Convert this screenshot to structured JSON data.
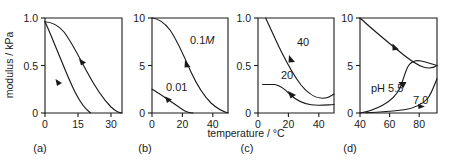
{
  "figure": {
    "shared_xlabel": "temperature / °C",
    "shared_ylabel": "modulus / kPa"
  },
  "chart_data": [
    {
      "type": "line",
      "panel": "(a)",
      "title": "",
      "xlabel": "temperature / °C",
      "ylabel": "modulus / kPa",
      "xlim": [
        0,
        35
      ],
      "ylim": [
        0,
        1.0
      ],
      "xticks": [
        0,
        15,
        30
      ],
      "xticklabels": [
        "0",
        "15",
        "30"
      ],
      "yticks": [
        0,
        0.5,
        1.0
      ],
      "yticklabels": [
        "0",
        "0.5",
        "1.0"
      ],
      "grid": false,
      "legend": "none",
      "series": [
        {
          "name": "upper-curve",
          "label": "",
          "x": [
            0,
            3,
            6,
            9,
            12,
            15,
            18,
            21,
            24,
            27,
            30,
            33,
            35
          ],
          "y": [
            0.96,
            0.955,
            0.94,
            0.9,
            0.84,
            0.75,
            0.64,
            0.52,
            0.39,
            0.26,
            0.13,
            0.04,
            0.0
          ]
        },
        {
          "name": "lower-curve",
          "label": "",
          "x": [
            0,
            2,
            4,
            6,
            8,
            10,
            12,
            14,
            16,
            18,
            20,
            22,
            23
          ],
          "y": [
            0.96,
            0.9,
            0.82,
            0.72,
            0.62,
            0.5,
            0.39,
            0.28,
            0.18,
            0.1,
            0.04,
            0.01,
            0.0
          ]
        }
      ]
    },
    {
      "type": "line",
      "panel": "(b)",
      "title": "",
      "xlabel": "temperature / °C",
      "ylabel": "modulus / kPa",
      "xlim": [
        0,
        50
      ],
      "ylim": [
        0,
        10
      ],
      "xticks": [
        0,
        20,
        40
      ],
      "xticklabels": [
        "0",
        "20",
        "40"
      ],
      "yticks": [
        0,
        5,
        10
      ],
      "yticklabels": [
        "0",
        "5",
        "10"
      ],
      "grid": false,
      "legend": "inline-annotations",
      "series": [
        {
          "name": "conc-0p1M",
          "label": "0.1M",
          "label_italic_tail": "M",
          "x": [
            0,
            5,
            10,
            15,
            20,
            25,
            30,
            35,
            40,
            45,
            50
          ],
          "y": [
            10.0,
            9.85,
            9.5,
            9.0,
            8.2,
            7.1,
            5.7,
            4.1,
            2.6,
            1.5,
            0.8
          ]
        },
        {
          "name": "conc-0p01",
          "label": "0.01",
          "x": [
            0,
            4,
            8,
            12,
            16,
            20,
            24,
            27
          ],
          "y": [
            2.5,
            2.2,
            1.85,
            1.45,
            1.0,
            0.55,
            0.15,
            0.0
          ]
        }
      ]
    },
    {
      "type": "line",
      "panel": "(c)",
      "title": "",
      "xlabel": "temperature / °C",
      "ylabel": "modulus / kPa",
      "xlim": [
        0,
        50
      ],
      "ylim": [
        0,
        1.0
      ],
      "xticks": [
        0,
        20,
        40
      ],
      "xticklabels": [
        "0",
        "20",
        "40"
      ],
      "yticks": [
        0,
        0.5,
        1.0
      ],
      "yticklabels": [
        "0",
        "0.5",
        "1.0"
      ],
      "grid": false,
      "legend": "inline-annotations",
      "series": [
        {
          "name": "curve-40",
          "label": "40",
          "x": [
            5,
            10,
            15,
            20,
            25,
            30,
            35,
            40,
            45,
            50
          ],
          "y": [
            1.0,
            0.84,
            0.7,
            0.58,
            0.48,
            0.39,
            0.32,
            0.27,
            0.23,
            0.2
          ]
        },
        {
          "name": "curve-20",
          "label": "20",
          "x": [
            3,
            8,
            12,
            16,
            20,
            24,
            28,
            32,
            36,
            40,
            45,
            50
          ],
          "y": [
            0.3,
            0.3,
            0.29,
            0.26,
            0.22,
            0.18,
            0.15,
            0.13,
            0.11,
            0.1,
            0.09,
            0.09
          ]
        }
      ]
    },
    {
      "type": "line",
      "panel": "(d)",
      "title": "",
      "xlabel": "temperature / °C",
      "ylabel": "modulus / kPa",
      "xlim": [
        40,
        92
      ],
      "ylim": [
        0,
        10
      ],
      "xticks": [
        40,
        60,
        80
      ],
      "xticklabels": [
        "40",
        "60",
        "80"
      ],
      "yticks": [
        0,
        5,
        10
      ],
      "yticklabels": [
        "0",
        "5",
        "10"
      ],
      "grid": false,
      "legend": "inline-annotations",
      "series": [
        {
          "name": "descending-curve",
          "label": "",
          "x": [
            40,
            50,
            60,
            70,
            78,
            84,
            88,
            92
          ],
          "y": [
            10.0,
            8.85,
            7.65,
            6.45,
            5.75,
            5.35,
            5.12,
            4.95
          ]
        },
        {
          "name": "pH-5p5-curve",
          "label": "pH 5.5",
          "x": [
            40,
            48,
            56,
            63,
            68,
            71,
            73,
            74.5,
            76,
            78,
            81,
            85,
            89,
            92
          ],
          "y": [
            0.0,
            0.12,
            0.28,
            0.48,
            0.75,
            1.25,
            2.3,
            3.6,
            4.5,
            4.95,
            5.15,
            5.12,
            5.05,
            4.95
          ]
        },
        {
          "name": "pH-7p0-curve",
          "label": "7.0",
          "x": [
            44,
            55,
            65,
            74,
            80,
            84,
            87,
            89,
            90.5,
            92
          ],
          "y": [
            0.02,
            0.05,
            0.1,
            0.18,
            0.3,
            0.5,
            0.85,
            1.5,
            2.5,
            3.6
          ]
        }
      ]
    }
  ],
  "panels": [
    {
      "label": "(a)"
    },
    {
      "label": "(b)"
    },
    {
      "label": "(c)"
    },
    {
      "label": "(d)"
    }
  ]
}
